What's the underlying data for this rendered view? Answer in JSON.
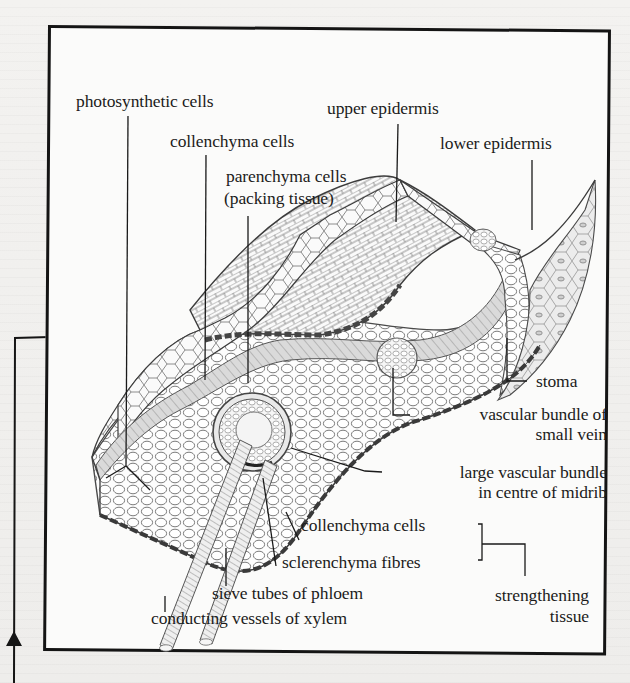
{
  "figure": {
    "labels": {
      "photosynthetic_cells": "photosynthetic cells",
      "upper_epidermis": "upper epidermis",
      "collenchyma_cells_top": "collenchyma cells",
      "lower_epidermis": "lower epidermis",
      "parenchyma_cells_line1": "parenchyma cells",
      "parenchyma_cells_line2": "(packing tissue)",
      "stoma": "stoma",
      "vascular_small_line1": "vascular bundle of",
      "vascular_small_line2": "small vein",
      "vascular_large_line1": "large vascular bundle",
      "vascular_large_line2": "in centre of midrib",
      "collenchyma_cells_bottom": "collenchyma cells",
      "sclerenchyma_fibres": "sclerenchyma fibres",
      "strengthening_line1": "strengthening",
      "strengthening_line2": "tissue",
      "sieve_tubes": "sieve tubes of phloem",
      "xylem_vessels": "conducting vessels of xylem"
    },
    "colors": {
      "ink": "#1a1a1a",
      "cell_outline": "#555555",
      "shade_gray": "#cfcfcf",
      "frame": "#141414",
      "paper": "#fbfbfa"
    }
  }
}
